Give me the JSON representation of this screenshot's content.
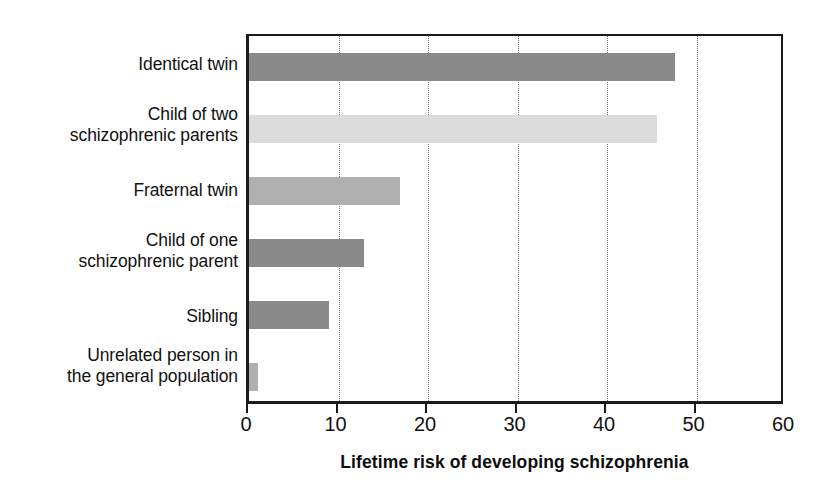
{
  "chart_data": {
    "type": "bar",
    "orientation": "horizontal",
    "title": "",
    "xlabel": "Lifetime risk of developing schizophrenia",
    "ylabel": "",
    "xlim": [
      0,
      60
    ],
    "xticks": [
      0,
      10,
      20,
      30,
      40,
      50,
      60
    ],
    "grid": "vertical dotted gridlines at each x tick",
    "legend": "none",
    "categories": [
      "Identical twin",
      "Child of two schizophrenic parents",
      "Fraternal twin",
      "Child of one schizophrenic parent",
      "Sibling",
      "Unrelated person in the general population"
    ],
    "values": [
      48,
      46,
      17,
      13,
      9,
      1
    ],
    "bar_colors": [
      "#8a8a8a",
      "#dcdcdc",
      "#b0b0b0",
      "#8a8a8a",
      "#8a8a8a",
      "#b0b0b0"
    ]
  },
  "axis": {
    "title": "Lifetime risk of developing schizophrenia",
    "tick_labels": [
      "0",
      "10",
      "20",
      "30",
      "40",
      "50",
      "60"
    ]
  },
  "categories": [
    {
      "line1": "Identical twin",
      "line2": ""
    },
    {
      "line1": "Child of two",
      "line2": "schizophrenic parents"
    },
    {
      "line1": "Fraternal twin",
      "line2": ""
    },
    {
      "line1": "Child of one",
      "line2": "schizophrenic parent"
    },
    {
      "line1": "Sibling",
      "line2": ""
    },
    {
      "line1": "Unrelated person in",
      "line2": "the general population"
    }
  ],
  "colors": {
    "axis": "#1a1a1a",
    "gridline": "#6e6e6e",
    "text": "#111111",
    "background": "#ffffff",
    "bar_dark": "#8a8a8a",
    "bar_medium": "#b0b0b0",
    "bar_light": "#dcdcdc"
  }
}
